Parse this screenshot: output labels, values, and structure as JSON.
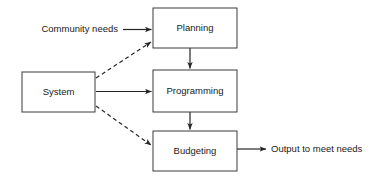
{
  "diagram": {
    "background_color": "#ffffff",
    "line_color": "#262626",
    "box_stroke_color": "#3a3a3a",
    "text_color": "#1a1a1a",
    "nodes": [
      {
        "id": "planning",
        "label": "Planning",
        "x": 153,
        "y": 8,
        "w": 84,
        "h": 40
      },
      {
        "id": "programming",
        "label": "Programming",
        "x": 153,
        "y": 70,
        "w": 84,
        "h": 42
      },
      {
        "id": "budgeting",
        "label": "Budgeting",
        "x": 153,
        "y": 131,
        "w": 84,
        "h": 40
      },
      {
        "id": "system",
        "label": "System",
        "x": 22,
        "y": 72,
        "w": 73,
        "h": 40
      }
    ],
    "free_labels": [
      {
        "id": "community-needs",
        "label": "Community needs",
        "x": 118,
        "y": 30,
        "anchor": "end"
      },
      {
        "id": "output-needs",
        "label": "Output to meet needs",
        "x": 271,
        "y": 149,
        "anchor": "start"
      }
    ],
    "edges": [
      {
        "id": "community-to-planning",
        "style": "solid",
        "from": "Community needs",
        "to": "Planning"
      },
      {
        "id": "planning-to-programming",
        "style": "solid",
        "from": "Planning",
        "to": "Programming"
      },
      {
        "id": "programming-to-budgeting",
        "style": "solid",
        "from": "Programming",
        "to": "Budgeting"
      },
      {
        "id": "system-to-programming",
        "style": "solid",
        "from": "System",
        "to": "Programming"
      },
      {
        "id": "system-to-planning",
        "style": "dashed",
        "from": "System",
        "to": "Planning"
      },
      {
        "id": "system-to-budgeting",
        "style": "dashed",
        "from": "System",
        "to": "Budgeting"
      },
      {
        "id": "budgeting-to-output",
        "style": "solid",
        "from": "Budgeting",
        "to": "Output to meet needs"
      }
    ]
  }
}
